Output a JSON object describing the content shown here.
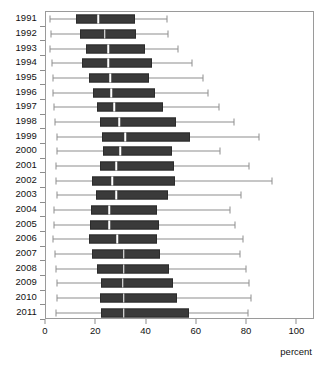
{
  "chart_data": {
    "type": "box",
    "title": "",
    "subtitle": "",
    "xlabel": "percent",
    "ylabel": "",
    "orientation": "horizontal",
    "grid": false,
    "legend": null,
    "xlim": [
      0,
      107
    ],
    "xticks": [
      0,
      20,
      40,
      60,
      80,
      100
    ],
    "xticklabels": [
      "0",
      "20",
      "40",
      "60",
      "80",
      "100"
    ],
    "categories": [
      "1991",
      "1992",
      "1993",
      "1994",
      "1995",
      "1996",
      "1997",
      "1998",
      "1999",
      "2000",
      "2001",
      "2002",
      "2003",
      "2004",
      "2005",
      "2006",
      "2007",
      "2008",
      "2009",
      "2010",
      "2011"
    ],
    "box_color": "#3a3a3a",
    "median_color": "#ffffff",
    "whisker_color": "#8d8d8d",
    "boxes": [
      {
        "category": "1991",
        "min": 1.6,
        "q1": 11.8,
        "median": 20.7,
        "q3": 35.4,
        "max": 48.0
      },
      {
        "category": "1992",
        "min": 1.9,
        "q1": 13.4,
        "median": 23.4,
        "q3": 35.9,
        "max": 48.5
      },
      {
        "category": "1993",
        "min": 1.6,
        "q1": 16.0,
        "median": 24.8,
        "q3": 39.2,
        "max": 52.4
      },
      {
        "category": "1994",
        "min": 2.3,
        "q1": 14.4,
        "median": 24.8,
        "q3": 42.0,
        "max": 58.1
      },
      {
        "category": "1995",
        "min": 2.7,
        "q1": 17.1,
        "median": 25.6,
        "q3": 41.1,
        "max": 62.4
      },
      {
        "category": "1996",
        "min": 2.7,
        "q1": 18.6,
        "median": 25.9,
        "q3": 43.4,
        "max": 64.5
      },
      {
        "category": "1997",
        "min": 3.1,
        "q1": 20.2,
        "median": 27.1,
        "q3": 46.5,
        "max": 69.0
      },
      {
        "category": "1998",
        "min": 3.5,
        "q1": 21.3,
        "median": 29.1,
        "q3": 51.6,
        "max": 74.8
      },
      {
        "category": "1999",
        "min": 4.3,
        "q1": 22.3,
        "median": 31.6,
        "q3": 57.4,
        "max": 84.8
      },
      {
        "category": "2000",
        "min": 4.3,
        "q1": 22.7,
        "median": 29.5,
        "q3": 50.0,
        "max": 69.4
      },
      {
        "category": "2001",
        "min": 3.9,
        "q1": 21.3,
        "median": 27.9,
        "q3": 50.8,
        "max": 80.6
      },
      {
        "category": "2002",
        "min": 3.9,
        "q1": 18.2,
        "median": 26.4,
        "q3": 51.2,
        "max": 89.8
      },
      {
        "category": "2003",
        "min": 4.3,
        "q1": 19.8,
        "median": 27.9,
        "q3": 48.4,
        "max": 77.5
      },
      {
        "category": "2004",
        "min": 3.1,
        "q1": 17.8,
        "median": 25.2,
        "q3": 44.2,
        "max": 73.3
      },
      {
        "category": "2005",
        "min": 3.1,
        "q1": 17.4,
        "median": 25.2,
        "q3": 44.9,
        "max": 75.2
      },
      {
        "category": "2006",
        "min": 2.7,
        "q1": 17.1,
        "median": 28.3,
        "q3": 44.2,
        "max": 78.3
      },
      {
        "category": "2007",
        "min": 3.5,
        "q1": 18.2,
        "median": 31.0,
        "q3": 45.3,
        "max": 77.1
      },
      {
        "category": "2008",
        "min": 3.9,
        "q1": 20.2,
        "median": 31.0,
        "q3": 48.8,
        "max": 79.4
      },
      {
        "category": "2009",
        "min": 4.3,
        "q1": 21.7,
        "median": 30.6,
        "q3": 50.4,
        "max": 80.6
      },
      {
        "category": "2010",
        "min": 4.3,
        "q1": 21.3,
        "median": 31.0,
        "q3": 52.3,
        "max": 81.4
      },
      {
        "category": "2011",
        "min": 3.9,
        "q1": 21.9,
        "median": 30.9,
        "q3": 57.0,
        "max": 80.5
      }
    ]
  }
}
